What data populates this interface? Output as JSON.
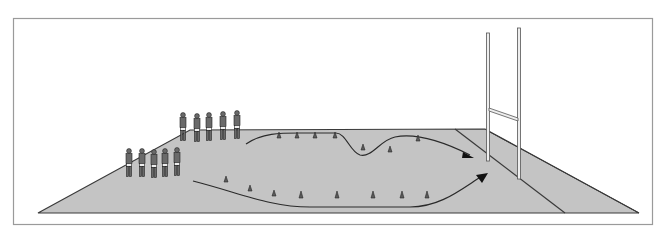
{
  "diagram": {
    "type": "rugby-drill-illustration",
    "colors": {
      "background": "#ffffff",
      "frame": "#9a9a9a",
      "field": "#c4c4c4",
      "outline": "#3a3a3a",
      "post": "#e8e8e8",
      "player": "#6a6a6a",
      "cone": "#5a5a5a"
    },
    "elements": {
      "players_back_row": 5,
      "players_front_row": 5,
      "cones_upper_path": 7,
      "cones_lower_path": 8,
      "run_paths": 2,
      "goal_posts": 1
    }
  }
}
